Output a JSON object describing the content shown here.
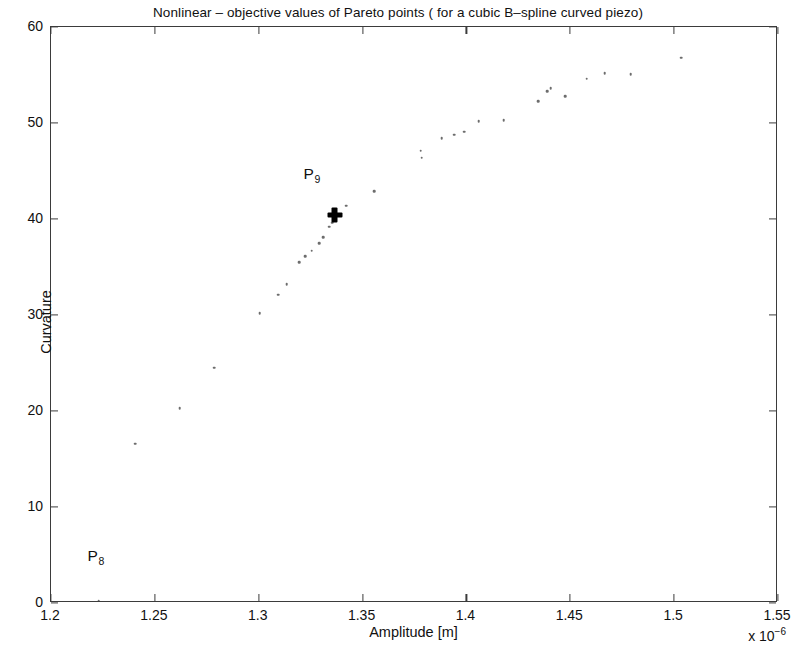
{
  "chart_data": {
    "type": "scatter",
    "title": "Nonlinear – objective values of Pareto points ( for a cubic B–spline curved piezo)",
    "xlabel": "Amplitude [m]",
    "ylabel": "Curvature",
    "x_exponent_label": "x 10",
    "x_exponent_power": "−6",
    "x_scale_factor": 1e-06,
    "xlim": [
      1.2,
      1.55
    ],
    "ylim": [
      0,
      60
    ],
    "xticks": [
      1.2,
      1.25,
      1.3,
      1.35,
      1.4,
      1.45,
      1.5,
      1.55
    ],
    "xticklabels": [
      "1.2",
      "1.25",
      "1.3",
      "1.35",
      "1.4",
      "1.45",
      "1.5",
      "1.55"
    ],
    "yticks": [
      0,
      10,
      20,
      30,
      40,
      50,
      60
    ],
    "yticklabels": [
      "0",
      "10",
      "20",
      "30",
      "40",
      "50",
      "60"
    ],
    "grid": false,
    "legend": null,
    "marker_color": "#6d6d6d",
    "highlight_color": "#000000",
    "frame_color": "#3b3b3b",
    "background": "#ffffff",
    "points": [
      [
        1.2405,
        16.6
      ],
      [
        1.262,
        20.3
      ],
      [
        1.2785,
        24.5
      ],
      [
        1.3005,
        30.2
      ],
      [
        1.3095,
        32.1
      ],
      [
        1.3135,
        33.2
      ],
      [
        1.3195,
        35.5
      ],
      [
        1.3225,
        36.1
      ],
      [
        1.3255,
        36.7
      ],
      [
        1.329,
        37.5
      ],
      [
        1.331,
        38.1
      ],
      [
        1.334,
        39.2
      ],
      [
        1.3355,
        39.6
      ],
      [
        1.342,
        41.4
      ],
      [
        1.3555,
        42.9
      ],
      [
        1.378,
        47.1
      ],
      [
        1.3785,
        46.4
      ],
      [
        1.388,
        48.4
      ],
      [
        1.394,
        48.8
      ],
      [
        1.399,
        49.1
      ],
      [
        1.406,
        50.2
      ],
      [
        1.418,
        50.3
      ],
      [
        1.4345,
        52.3
      ],
      [
        1.439,
        53.3
      ],
      [
        1.4405,
        53.6
      ],
      [
        1.4475,
        52.8
      ],
      [
        1.458,
        54.6
      ],
      [
        1.4665,
        55.2
      ],
      [
        1.479,
        55.1
      ],
      [
        1.5035,
        56.8
      ]
    ],
    "highlighted_points": [
      {
        "label": "P",
        "subscript": "9",
        "x": 1.3365,
        "y": 40.4,
        "marker": "plus",
        "label_dx": -0.011,
        "label_dy": 4.3
      },
      {
        "label": "P",
        "subscript": "8",
        "x": 1.223,
        "y": 0.25,
        "marker": "dot",
        "label_dx": -0.0015,
        "label_dy": 4.6
      }
    ]
  }
}
